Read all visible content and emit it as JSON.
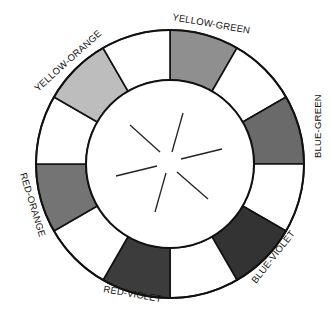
{
  "diagram": {
    "type": "color-wheel",
    "center": [
      170,
      164
    ],
    "outer_radius": 134,
    "inner_radius": 84,
    "stroke_color": "#111111",
    "segments": [
      {
        "name": "yellow-green",
        "label": "YELLOW-GREEN",
        "fill": "#8f8f8f",
        "start": -90,
        "end": -60,
        "labeled": true
      },
      {
        "name": "blank-1",
        "label": "",
        "fill": "#ffffff",
        "start": -60,
        "end": -30,
        "labeled": false
      },
      {
        "name": "blue-green",
        "label": "BLUE-GREEN",
        "fill": "#6a6a6a",
        "start": -30,
        "end": 0,
        "labeled": true
      },
      {
        "name": "blank-2",
        "label": "",
        "fill": "#ffffff",
        "start": 0,
        "end": 30,
        "labeled": false
      },
      {
        "name": "blue-violet",
        "label": "BLUE-VIOLET",
        "fill": "#333333",
        "start": 30,
        "end": 60,
        "labeled": true
      },
      {
        "name": "blank-3",
        "label": "",
        "fill": "#ffffff",
        "start": 60,
        "end": 90,
        "labeled": false
      },
      {
        "name": "red-violet",
        "label": "RED-VIOLET",
        "fill": "#3c3c3c",
        "start": 90,
        "end": 120,
        "labeled": true
      },
      {
        "name": "blank-4",
        "label": "",
        "fill": "#ffffff",
        "start": 120,
        "end": 150,
        "labeled": false
      },
      {
        "name": "red-orange",
        "label": "RED-ORANGE",
        "fill": "#747474",
        "start": 150,
        "end": 180,
        "labeled": true
      },
      {
        "name": "blank-5",
        "label": "",
        "fill": "#ffffff",
        "start": 180,
        "end": 210,
        "labeled": false
      },
      {
        "name": "yellow-orange",
        "label": "YELLOW-ORANGE",
        "fill": "#bdbdbd",
        "start": 210,
        "end": 240,
        "labeled": true
      },
      {
        "name": "blank-6",
        "label": "",
        "fill": "#ffffff",
        "start": 240,
        "end": 270,
        "labeled": false
      }
    ],
    "labels": {
      "yellow_green": "YELLOW-GREEN",
      "blue_green": "BLUE-GREEN",
      "blue_violet": "BLUE-VIOLET",
      "red_violet": "RED-VIOLET",
      "red_orange": "RED-ORANGE",
      "yellow_orange": "YELLOW-ORANGE"
    },
    "center_lines": [
      [
        130,
        125,
        160,
        152
      ],
      [
        183,
        113,
        172,
        152
      ],
      [
        222,
        149,
        181,
        159
      ],
      [
        177,
        172,
        208,
        199
      ],
      [
        166,
        173,
        155,
        212
      ],
      [
        157,
        166,
        116,
        176
      ]
    ]
  }
}
